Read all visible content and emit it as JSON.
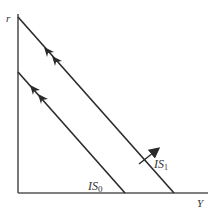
{
  "diagram": {
    "title": "",
    "axes": {
      "y_label": "r",
      "x_label": "Y"
    },
    "curves": [
      {
        "id": "inner",
        "label_main": "IS",
        "label_sub": "0"
      },
      {
        "id": "outer",
        "label_main": "IS",
        "label_sub": "1"
      }
    ],
    "shift_arrow": {
      "direction": "outward"
    },
    "colors": {
      "line": "#2a2a2a",
      "axis": "#555555",
      "background": "#ffffff"
    }
  }
}
